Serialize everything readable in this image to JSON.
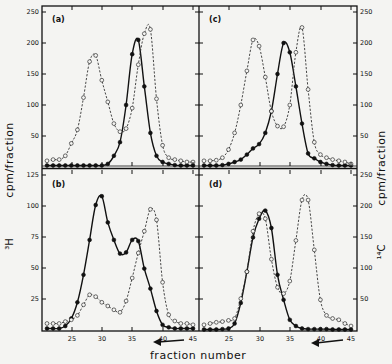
{
  "chart_data": [
    {
      "type": "line",
      "panel": "(a)",
      "xlabel": "fraction number",
      "ylabel_left": "³H cpm/fraction",
      "ylabel_right": "¹⁴C cpm/fraction",
      "xlim": [
        21,
        45
      ],
      "ylim": [
        0,
        250
      ],
      "x": [
        21,
        22,
        23,
        24,
        25,
        26,
        27,
        28,
        29,
        30,
        31,
        32,
        33,
        34,
        35,
        36,
        37,
        38,
        39,
        40,
        41,
        42,
        43,
        44,
        45
      ],
      "series": [
        {
          "name": "3H (filled circles, solid)",
          "style": "solid-filled",
          "values": [
            2,
            2,
            2,
            2,
            2,
            2,
            2,
            2,
            2,
            2,
            5,
            18,
            40,
            100,
            182,
            205,
            130,
            55,
            18,
            8,
            5,
            3,
            2,
            2,
            2
          ]
        },
        {
          "name": "14C (open circles, dashed)",
          "style": "dashed-open",
          "values": [
            10,
            12,
            12,
            18,
            38,
            60,
            112,
            170,
            180,
            140,
            105,
            70,
            57,
            62,
            95,
            165,
            215,
            222,
            110,
            35,
            15,
            12,
            10,
            8,
            8
          ]
        }
      ],
      "y_ticks": [
        50,
        100,
        150,
        200,
        250
      ],
      "grid": false
    },
    {
      "type": "line",
      "panel": "(b)",
      "xlabel": "fraction number",
      "xlim": [
        21,
        45
      ],
      "ylim_left": [
        0,
        125
      ],
      "ylim_right": [
        0,
        250
      ],
      "x": [
        21,
        22,
        23,
        24,
        25,
        26,
        27,
        28,
        29,
        30,
        31,
        32,
        33,
        34,
        35,
        36,
        37,
        38,
        39,
        40,
        41,
        42,
        43,
        44,
        45
      ],
      "series": [
        {
          "name": "3H (filled circles, solid)",
          "style": "solid-filled",
          "axis": "left",
          "values": [
            2,
            2,
            2,
            4,
            10,
            23,
            45,
            73,
            101,
            108,
            87,
            73,
            62,
            63,
            73,
            72,
            50,
            34,
            16,
            5,
            3,
            2,
            2,
            2,
            2
          ]
        },
        {
          "name": "14C (open circles, dashed)",
          "style": "dashed-open",
          "axis": "right",
          "values": [
            12,
            12,
            12,
            15,
            18,
            25,
            42,
            58,
            55,
            46,
            40,
            34,
            30,
            48,
            85,
            125,
            160,
            195,
            178,
            78,
            26,
            16,
            12,
            12,
            10
          ]
        }
      ],
      "y_ticks_left": [
        25,
        50,
        75,
        100,
        125
      ],
      "x_ticks": [
        25,
        30,
        35,
        40,
        45
      ],
      "grid": false
    },
    {
      "type": "line",
      "panel": "(c)",
      "xlim": [
        21,
        45
      ],
      "ylim": [
        0,
        250
      ],
      "x": [
        21,
        22,
        23,
        24,
        25,
        26,
        27,
        28,
        29,
        30,
        31,
        32,
        33,
        34,
        35,
        36,
        37,
        38,
        39,
        40,
        41,
        42,
        43,
        44,
        45
      ],
      "series": [
        {
          "name": "3H (filled circles, solid)",
          "style": "solid-filled",
          "values": [
            1,
            1,
            2,
            3,
            5,
            8,
            12,
            20,
            30,
            37,
            55,
            90,
            150,
            200,
            185,
            130,
            70,
            22,
            14,
            8,
            5,
            3,
            2,
            2,
            1
          ]
        },
        {
          "name": "14C (open circles, dashed)",
          "style": "dashed-open",
          "values": [
            10,
            10,
            11,
            15,
            28,
            55,
            100,
            155,
            205,
            195,
            145,
            90,
            66,
            65,
            100,
            185,
            225,
            125,
            40,
            20,
            15,
            12,
            10,
            8,
            5
          ]
        }
      ],
      "y_ticks_right": [
        50,
        100,
        150,
        200,
        250
      ],
      "grid": false
    },
    {
      "type": "line",
      "panel": "(d)",
      "xlabel": "fraction number",
      "xlim": [
        21,
        45
      ],
      "ylim": [
        0,
        250
      ],
      "x": [
        21,
        22,
        23,
        24,
        25,
        26,
        27,
        28,
        29,
        30,
        31,
        32,
        33,
        34,
        35,
        36,
        37,
        38,
        39,
        40,
        41,
        42,
        43,
        44,
        45
      ],
      "series": [
        {
          "name": "3H (filled circles, solid)",
          "style": "solid-filled",
          "values": [
            2,
            2,
            2,
            3,
            4,
            12,
            45,
            95,
            150,
            180,
            193,
            165,
            90,
            50,
            18,
            8,
            4,
            3,
            3,
            3,
            3,
            2,
            2,
            2,
            2
          ]
        },
        {
          "name": "14C (open circles, dashed)",
          "style": "dashed-open",
          "values": [
            10,
            12,
            14,
            15,
            17,
            20,
            52,
            95,
            160,
            188,
            180,
            115,
            70,
            60,
            80,
            145,
            210,
            210,
            130,
            50,
            25,
            20,
            18,
            12,
            8
          ]
        }
      ],
      "y_ticks_right": [
        50,
        100,
        150,
        200,
        250
      ],
      "x_ticks": [
        25,
        30,
        35,
        40,
        45
      ],
      "grid": false
    }
  ],
  "labels": {
    "panel_a": "(a)",
    "panel_b": "(b)",
    "panel_c": "(c)",
    "panel_d": "(d)",
    "x_axis_title": "fraction number",
    "y_left_title": "cpm/fraction",
    "y_left_isotope": "³H",
    "y_right_title": "cpm/fraction",
    "y_right_isotope": "¹⁴C",
    "arrow": "←"
  },
  "ticks": {
    "top_left_y": [
      "250",
      "200",
      "150",
      "100",
      "50"
    ],
    "bottom_left_y": [
      "125",
      "100",
      "75",
      "50",
      "25"
    ],
    "top_right_y": [
      "250",
      "200",
      "150",
      "100",
      "50"
    ],
    "bottom_right_y": [
      "250",
      "200",
      "150",
      "100",
      "50"
    ],
    "x": [
      "25",
      "30",
      "35",
      "40",
      "45"
    ]
  },
  "colors": {
    "ink": "#111111",
    "paper": "#f4f4f2"
  }
}
